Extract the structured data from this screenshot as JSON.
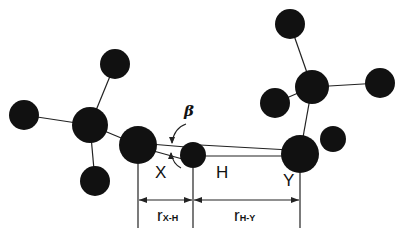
{
  "diagram": {
    "type": "hydrogen-bond-geometry",
    "labels": {
      "donor": "X",
      "hydrogen": "H",
      "acceptor": "Y",
      "angle": "β",
      "dist_xh_main": "r",
      "dist_xh_sub": "X-H",
      "dist_hy_main": "r",
      "dist_hy_sub": "H-Y"
    },
    "colors": {
      "atom": "#111111",
      "bond": "#222222",
      "background": "#ffffff"
    },
    "atoms": [
      {
        "id": "c1",
        "cx": 90,
        "cy": 125,
        "r": 18
      },
      {
        "id": "h1a",
        "cx": 115,
        "cy": 64,
        "r": 15
      },
      {
        "id": "h1b",
        "cx": 24,
        "cy": 115,
        "r": 15
      },
      {
        "id": "h1c",
        "cx": 95,
        "cy": 181,
        "r": 15
      },
      {
        "id": "X",
        "cx": 138,
        "cy": 145,
        "r": 19
      },
      {
        "id": "H",
        "cx": 193,
        "cy": 155,
        "r": 13
      },
      {
        "id": "Y",
        "cx": 300,
        "cy": 154,
        "r": 19
      },
      {
        "id": "c2",
        "cx": 312,
        "cy": 87,
        "r": 17
      },
      {
        "id": "h2a",
        "cx": 290,
        "cy": 24,
        "r": 15
      },
      {
        "id": "h2b",
        "cx": 380,
        "cy": 83,
        "r": 15
      },
      {
        "id": "h2c",
        "cx": 275,
        "cy": 103,
        "r": 15
      },
      {
        "id": "h2d",
        "cx": 333,
        "cy": 139,
        "r": 13
      }
    ]
  }
}
